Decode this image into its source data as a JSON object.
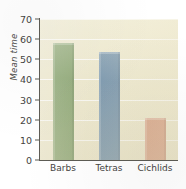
{
  "chart_data": {
    "type": "bar",
    "title": "",
    "subtitle": "",
    "xlabel": "",
    "ylabel": "Mean time",
    "categories": [
      "Barbs",
      "Tetras",
      "Cichlids"
    ],
    "values": [
      58,
      53.5,
      21
    ],
    "ylim": [
      0,
      70
    ],
    "yticks": [
      0,
      10,
      20,
      30,
      40,
      50,
      60,
      70
    ],
    "ytick_labels": [
      "0",
      "10",
      "20",
      "30",
      "40",
      "50",
      "60",
      "70"
    ],
    "grid": "horizontal",
    "legend": "none",
    "annotations": [],
    "bar_colors": [
      "#8fa876",
      "#7e9ab0",
      "#d9a287"
    ],
    "plot_background": "#eee9cf",
    "axis_color": "#5d5c55",
    "gridline_color": "#ffffff",
    "text_color": "#45443f"
  }
}
